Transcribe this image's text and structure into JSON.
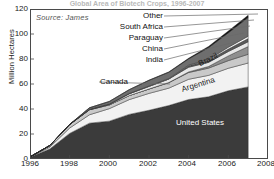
{
  "title": "Global Area of Biotech Crops, 1996-2007",
  "source_note": "Source: James",
  "axes": {
    "ylabel": "Million Hectares",
    "yticks": [
      "0",
      "20",
      "40",
      "60",
      "80",
      "100",
      "120"
    ],
    "xticks": [
      "1996",
      "1998",
      "2000",
      "2002",
      "2004",
      "2006",
      "2008"
    ]
  },
  "callouts": [
    {
      "label": "Other"
    },
    {
      "label": "South Africa"
    },
    {
      "label": "Paraguay"
    },
    {
      "label": "China"
    },
    {
      "label": "India"
    },
    {
      "label": "Canada"
    }
  ],
  "inline_labels": [
    {
      "label": "Brazil"
    },
    {
      "label": "Argentina"
    },
    {
      "label": "United States"
    }
  ],
  "colors": {
    "united_states": "#3b3b3b",
    "argentina": "#f2f2f2",
    "canada": "#c9c9c9",
    "india": "#8f8f8f",
    "china": "#e8e8e8",
    "paraguay": "#5a5a5a",
    "south_africa": "#ffffff",
    "brazil": "#6e6e6e",
    "other": "#111111",
    "axis": "#4a4a4a",
    "background": "#ffffff"
  },
  "chart_data": {
    "type": "area",
    "stacked": true,
    "title": "Global Area of Biotech Crops, 1996-2007",
    "xlabel": "",
    "ylabel": "Million Hectares",
    "xlim": [
      1996,
      2008
    ],
    "ylim": [
      0,
      120
    ],
    "grid": false,
    "legend": "inline-labels-and-callouts",
    "x": [
      1996,
      1997,
      1998,
      1999,
      2000,
      2001,
      2002,
      2003,
      2004,
      2005,
      2006,
      2007
    ],
    "series": [
      {
        "name": "United States",
        "values": [
          1.5,
          8.1,
          20.5,
          28.7,
          30.3,
          35.7,
          39.0,
          42.8,
          47.6,
          49.8,
          54.6,
          57.7
        ]
      },
      {
        "name": "Argentina",
        "values": [
          0.1,
          1.4,
          4.3,
          6.7,
          10.0,
          11.8,
          13.5,
          13.9,
          16.2,
          17.1,
          18.0,
          19.1
        ]
      },
      {
        "name": "Canada",
        "values": [
          0.1,
          1.3,
          2.8,
          4.0,
          3.0,
          3.2,
          3.5,
          4.4,
          5.4,
          5.8,
          6.1,
          7.0
        ]
      },
      {
        "name": "India",
        "values": [
          0.0,
          0.0,
          0.0,
          0.0,
          0.0,
          0.0,
          0.0,
          0.1,
          0.5,
          1.3,
          3.8,
          6.2
        ]
      },
      {
        "name": "China",
        "values": [
          0.0,
          0.0,
          0.0,
          0.3,
          0.5,
          1.5,
          2.1,
          2.8,
          3.7,
          3.3,
          3.5,
          3.8
        ]
      },
      {
        "name": "Paraguay",
        "values": [
          0.0,
          0.0,
          0.0,
          0.0,
          0.0,
          0.0,
          0.0,
          0.0,
          1.2,
          1.8,
          2.0,
          2.6
        ]
      },
      {
        "name": "South Africa",
        "values": [
          0.0,
          0.0,
          0.1,
          0.1,
          0.2,
          0.2,
          0.3,
          0.4,
          0.5,
          0.5,
          1.4,
          1.8
        ]
      },
      {
        "name": "Brazil",
        "values": [
          0.0,
          0.0,
          0.0,
          1.2,
          2.0,
          3.0,
          4.5,
          5.0,
          5.0,
          9.4,
          11.5,
          15.0
        ]
      },
      {
        "name": "Other",
        "values": [
          0.0,
          0.0,
          0.0,
          0.0,
          0.1,
          0.1,
          0.2,
          0.3,
          0.5,
          1.0,
          1.5,
          1.8
        ]
      }
    ],
    "totals": [
      1.7,
      11.0,
      27.8,
      39.9,
      44.2,
      52.6,
      58.7,
      67.7,
      81.0,
      90.0,
      102.0,
      114.3
    ]
  }
}
